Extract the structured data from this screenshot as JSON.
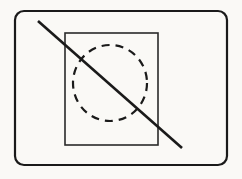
{
  "figure": {
    "width": 242,
    "height": 179,
    "background_color": "#faf9f6",
    "stroke_color": "#1a1a1a"
  },
  "shapes": {
    "outer_frame": {
      "name": "rounded-rectangle-border",
      "x": 15,
      "y": 11,
      "width": 212,
      "height": 154,
      "corner_radius": 9,
      "stroke_width": 2.2,
      "stroke_color": "#1a1a1a",
      "fill": "none"
    },
    "inner_rect": {
      "name": "inner-rectangle",
      "x": 65,
      "y": 33,
      "width": 93,
      "height": 112,
      "stroke_width": 1.6,
      "stroke_color": "#2a2a2a",
      "fill": "none"
    },
    "dashed_circle": {
      "name": "dashed-ellipse",
      "cx": 110,
      "cy": 83,
      "rx": 37,
      "ry": 38,
      "stroke_width": 2.2,
      "stroke_color": "#1a1a1a",
      "dash_length": 8,
      "dash_gap": 6,
      "dash_array": "8 6",
      "fill": "none"
    },
    "diagonal_slash": {
      "name": "diagonal-strike-line",
      "x1": 38,
      "y1": 21,
      "x2": 182,
      "y2": 148,
      "stroke_width": 2.6,
      "stroke_color": "#1a1a1a",
      "linecap": "butt"
    }
  }
}
